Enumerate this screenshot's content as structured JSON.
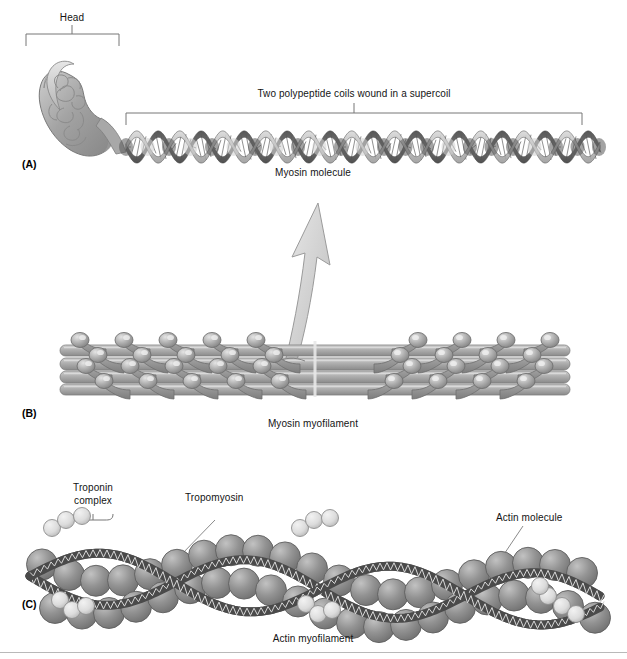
{
  "figure": {
    "background": "#ffffff"
  },
  "panels": [
    {
      "id": "A",
      "id_label": "(A)",
      "caption": "Myosin molecule",
      "brackets": [
        {
          "name": "head-bracket",
          "label": "Head"
        },
        {
          "name": "supercoil-bracket",
          "label": "Two polypeptide coils wound in a supercoil"
        }
      ],
      "parts": [
        "myosin-head",
        "myosin-tail-supercoil"
      ]
    },
    {
      "id": "B",
      "id_label": "(B)",
      "caption": "Myosin myofilament",
      "parts": [
        "myosin-rod-bundle",
        "myosin-heads",
        "bare-zone",
        "zoom-arrow"
      ]
    },
    {
      "id": "C",
      "id_label": "(C)",
      "caption": "Actin myofilament",
      "labels": [
        {
          "name": "troponin-complex-label",
          "text_line1": "Troponin",
          "text_line2": "complex"
        },
        {
          "name": "tropomyosin-label",
          "text": "Tropomyosin"
        },
        {
          "name": "actin-molecule-label",
          "text": "Actin molecule"
        }
      ],
      "parts": [
        "actin-spheres",
        "tropomyosin-strands",
        "troponin-spheres"
      ]
    }
  ],
  "colors": {
    "ink": "#141414",
    "line": "#6e6e6e",
    "actin_sphere": "#8d8d8d",
    "actin_sphere_light": "#b7b7b7",
    "troponin_sphere": "#dcdcdc",
    "tropomyosin": "#4a4a4a",
    "rod_mid": "#9a9a9a",
    "rod_light": "#c9c9c9",
    "rod_dark": "#777777",
    "head_fill": "#a9a9a9",
    "arrow_fill": "#d2d2d2",
    "bracket": "#767676",
    "rule": "#b9b9b9"
  }
}
